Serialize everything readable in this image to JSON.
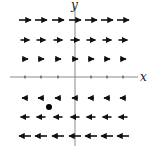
{
  "figure": {
    "x_axis_label": "x",
    "y_axis_label": "y",
    "axis_color": "#888888",
    "arrow_color": "#111111",
    "point_color": "#000000"
  },
  "axes": {
    "origin_px": [
      75,
      77
    ],
    "x_range_px": [
      10,
      138
    ],
    "y_range_px": [
      6,
      146
    ],
    "x_ticks_px": [
      25,
      41,
      58,
      91,
      107,
      123
    ]
  },
  "rows": [
    {
      "y_px": 20,
      "direction": "right",
      "length": 12,
      "x_centers_px": [
        25,
        41,
        58,
        75,
        91,
        107,
        123
      ]
    },
    {
      "y_px": 40,
      "direction": "right",
      "length": 9,
      "x_centers_px": [
        25,
        41,
        58,
        75,
        91,
        107,
        123
      ]
    },
    {
      "y_px": 59,
      "direction": "right",
      "length": 6,
      "x_centers_px": [
        25,
        41,
        58,
        75,
        91,
        107,
        123
      ]
    },
    {
      "y_px": 98,
      "direction": "left",
      "length": 6,
      "x_centers_px": [
        25,
        41,
        58,
        75,
        91,
        107,
        123
      ]
    },
    {
      "y_px": 117,
      "direction": "left",
      "length": 9,
      "x_centers_px": [
        25,
        41,
        58,
        75,
        91,
        107,
        123
      ]
    },
    {
      "y_px": 136,
      "direction": "left",
      "length": 12,
      "x_centers_px": [
        25,
        41,
        58,
        75,
        91,
        107,
        123
      ]
    }
  ],
  "point": {
    "x_px": 49,
    "y_px": 107,
    "r": 3
  }
}
